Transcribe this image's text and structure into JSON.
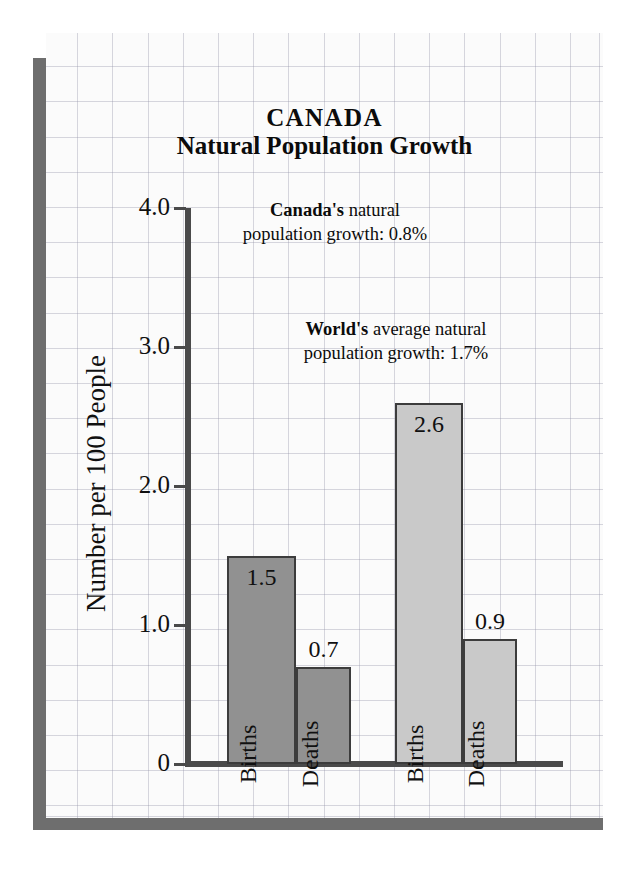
{
  "chart_data": {
    "type": "bar",
    "title": "CANADA",
    "subtitle": "Natural Population Growth",
    "ylabel": "Number per 100 People",
    "xlabel": "",
    "ylim": [
      0,
      4.0
    ],
    "yticks": [
      "0",
      "1.0",
      "2.0",
      "3.0",
      "4.0"
    ],
    "ytick_values": [
      0,
      1.0,
      2.0,
      3.0,
      4.0
    ],
    "grid": true,
    "legend": "none",
    "groups": [
      {
        "name": "Canada",
        "color": "#919191",
        "bars": [
          {
            "label": "Births",
            "value": 1.5,
            "value_label": "1.5"
          },
          {
            "label": "Deaths",
            "value": 0.7,
            "value_label": "0.7"
          }
        ]
      },
      {
        "name": "World",
        "color": "#c9c9c9",
        "bars": [
          {
            "label": "Births",
            "value": 2.6,
            "value_label": "2.6"
          },
          {
            "label": "Deaths",
            "value": 0.9,
            "value_label": "0.9"
          }
        ]
      }
    ],
    "categories": [
      "Canada Births",
      "Canada Deaths",
      "World Births",
      "World Deaths"
    ],
    "values": [
      1.5,
      0.7,
      2.6,
      0.9
    ],
    "annotations": [
      {
        "id": "canada",
        "bold_lead": "Canada's",
        "rest_line1": " natural",
        "line2": "population growth:  0.8%",
        "value": "0.8%"
      },
      {
        "id": "world",
        "bold_lead": "World's",
        "rest_line1": " average natural",
        "line2": "population growth:  1.7%",
        "value": "1.7%"
      }
    ]
  },
  "colors": {
    "canada_bar": "#919191",
    "world_bar": "#c9c9c9",
    "bar_outline": "#3c3c3c",
    "axis": "#4a4a4a",
    "card_bg": "#fbfbfb",
    "shadow": "#6e6e6e",
    "text": "#101010"
  }
}
